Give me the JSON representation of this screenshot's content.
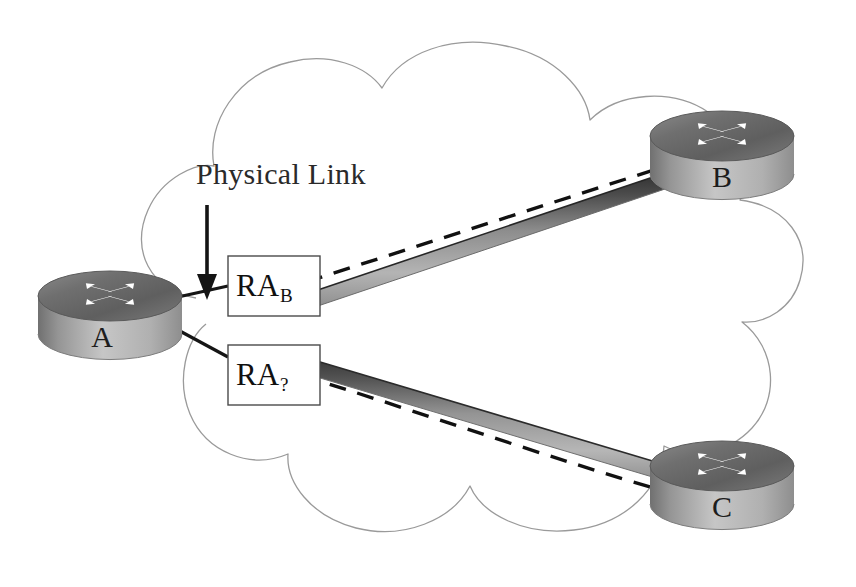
{
  "diagram": {
    "type": "network-topology",
    "background_color": "#ffffff",
    "cloud": {
      "name": "network-cloud",
      "stroke_color": "#9a9a9a",
      "stroke_width": 1.2,
      "fill": "none",
      "style": "scalloped outline"
    },
    "annotation": {
      "label": "Physical Link",
      "arrow": {
        "name": "annotation-arrow",
        "direction": "down",
        "color": "#1a1a1a"
      }
    },
    "routers": [
      {
        "id": "A",
        "label": "A",
        "position": "left",
        "icon": "router-icon",
        "top_color": "#6e6e6e",
        "body_color": "#b8b8b8",
        "arrow_color": "#ffffff"
      },
      {
        "id": "B",
        "label": "B",
        "position": "top-right",
        "icon": "router-icon",
        "top_color": "#6e6e6e",
        "body_color": "#b8b8b8",
        "arrow_color": "#ffffff"
      },
      {
        "id": "C",
        "label": "C",
        "position": "bottom-right",
        "icon": "router-icon",
        "top_color": "#6e6e6e",
        "body_color": "#b8b8b8",
        "arrow_color": "#ffffff"
      }
    ],
    "adjacency_labels": [
      {
        "name": "ra-b-box",
        "base": "RA",
        "subscript": "B",
        "border_color": "#4a4a4a",
        "fill": "#ffffff"
      },
      {
        "name": "ra-unknown-box",
        "base": "RA",
        "subscript": "?",
        "border_color": "#4a4a4a",
        "fill": "#ffffff"
      }
    ],
    "links": [
      {
        "name": "physical-link-a-b",
        "from": "A",
        "to": "B",
        "style": "solid-3d-bar",
        "highlight_color": "#3a3a3a",
        "body_color": "#a9a9a9"
      },
      {
        "name": "physical-link-a-c",
        "from": "A",
        "to": "C",
        "style": "solid-3d-bar",
        "highlight_color": "#3a3a3a",
        "body_color": "#a9a9a9"
      },
      {
        "name": "logical-adjacency-a-b",
        "from": "A",
        "to": "B",
        "style": "dashed",
        "color": "#111111"
      },
      {
        "name": "logical-adjacency-a-c",
        "from": "A",
        "to": "C",
        "style": "dashed",
        "color": "#111111"
      }
    ]
  }
}
